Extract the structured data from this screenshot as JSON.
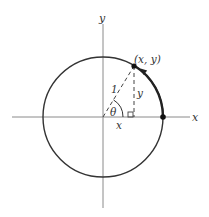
{
  "diagram": {
    "labels": {
      "y_axis": "y",
      "x_axis": "x",
      "point": "(x, y)",
      "radius": "1",
      "vertical_leg": "y",
      "horizontal_leg": "x",
      "angle": "θ"
    },
    "geometry": {
      "origin": [
        103,
        117
      ],
      "radius_px": 60,
      "point_px": [
        134,
        66
      ],
      "start_point_px": [
        163,
        117
      ]
    },
    "colors": {
      "axis": "#888888",
      "circle": "#333333",
      "arc_highlight": "#222222",
      "dash": "#444444",
      "text": "#333333"
    }
  }
}
